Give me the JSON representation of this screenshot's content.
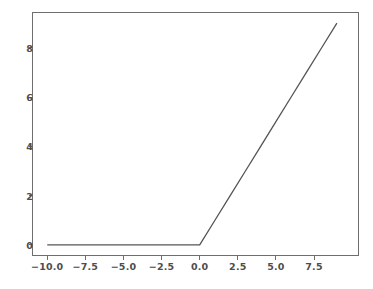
{
  "chart_data": {
    "type": "line",
    "title": "",
    "subtitle": "",
    "xlabel": "",
    "ylabel": "",
    "xlim": [
      -11.0,
      10.45
    ],
    "ylim": [
      -0.45,
      9.45
    ],
    "xticks": [
      -10.0,
      -7.5,
      -5.0,
      -2.5,
      0.0,
      2.5,
      5.0,
      7.5
    ],
    "xtick_labels": [
      "−10.0",
      "−7.5",
      "−5.0",
      "−2.5",
      "0.0",
      "2.5",
      "5.0",
      "7.5"
    ],
    "yticks": [
      0,
      2,
      4,
      6,
      8
    ],
    "ytick_labels": [
      "0",
      "2",
      "4",
      "6",
      "8"
    ],
    "grid": false,
    "legend": null,
    "series": [
      {
        "name": "relu",
        "color": "#555555",
        "linewidth": 1.3,
        "x": [
          -10.0,
          -9.0,
          -8.0,
          -7.0,
          -6.0,
          -5.0,
          -4.0,
          -3.0,
          -2.0,
          -1.0,
          0.0,
          1.0,
          2.0,
          3.0,
          4.0,
          5.0,
          6.0,
          7.0,
          8.0,
          9.0
        ],
        "y": [
          0.0,
          0.0,
          0.0,
          0.0,
          0.0,
          0.0,
          0.0,
          0.0,
          0.0,
          0.0,
          0.0,
          1.0,
          2.0,
          3.0,
          4.0,
          5.0,
          6.0,
          7.0,
          8.0,
          9.0
        ]
      }
    ],
    "annotations": []
  },
  "figure": {
    "background_color": "#ffffff",
    "axes_edge_color": "#6e6e6e",
    "tick_label_color": "#4d4d4d"
  }
}
